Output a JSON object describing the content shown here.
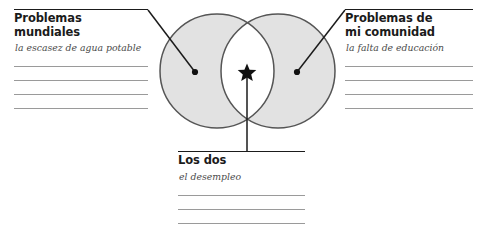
{
  "worksheet": {
    "type": "venn-diagram-worksheet",
    "language": "es"
  },
  "panels": {
    "left": {
      "title": "Problemas mundiales",
      "answer": "la escasez de agua potable",
      "blank_lines": 4
    },
    "right": {
      "title": "Problemas de\nmi comunidad",
      "answer": "la falta de educación",
      "blank_lines": 4
    },
    "bottom": {
      "title": "Los dos",
      "answer": "el desempleo",
      "blank_lines": 3
    }
  },
  "diagram": {
    "left_circle": {
      "cx": 217,
      "cy": 71,
      "r": 57
    },
    "right_circle": {
      "cx": 278,
      "cy": 71,
      "r": 57
    },
    "fill_color": "#e2e2e2",
    "stroke_color": "#555555",
    "intersection_fill": "#ffffff",
    "star_marker": {
      "x": 247,
      "y": 72,
      "glyph": "star"
    },
    "left_dot": {
      "x": 195,
      "y": 72
    },
    "right_dot": {
      "x": 297,
      "y": 72
    },
    "leader_lines": [
      {
        "name": "left-leader",
        "x1": 148,
        "y1": 10,
        "x2": 195,
        "y2": 72
      },
      {
        "name": "right-leader",
        "x1": 345,
        "y1": 10,
        "x2": 297,
        "y2": 72
      },
      {
        "name": "bottom-leader",
        "x1": 247,
        "y1": 72,
        "x2": 247,
        "y2": 152
      }
    ]
  }
}
